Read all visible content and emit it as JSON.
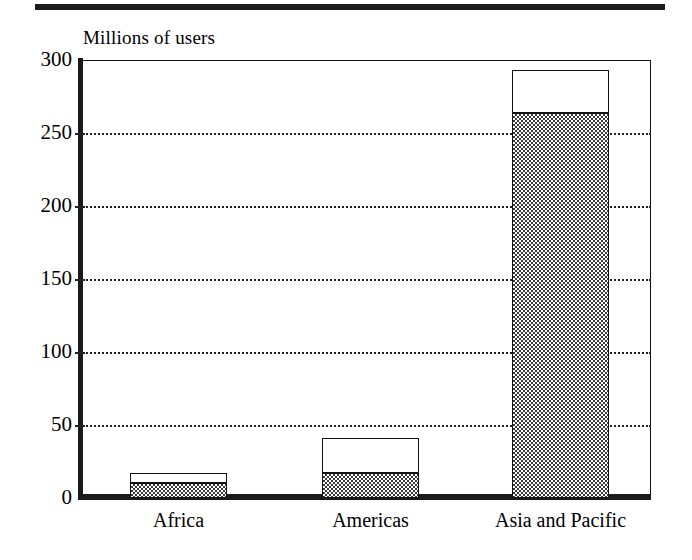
{
  "figure": {
    "top_rule": "decorative-rule"
  },
  "chart_data": {
    "type": "bar",
    "stacked": true,
    "title": "",
    "ylabel": "Millions of users",
    "xlabel": "",
    "categories": [
      "Africa",
      "Americas",
      "Asia and Pacific"
    ],
    "series": [
      {
        "name": "lower-segment",
        "pattern": "checkered",
        "values": [
          10,
          17,
          264
        ]
      },
      {
        "name": "upper-segment",
        "pattern": "white",
        "values": [
          7,
          24,
          29
        ]
      }
    ],
    "totals": [
      17,
      41,
      293
    ],
    "ylim": [
      0,
      300
    ],
    "yticks": [
      0,
      50,
      100,
      150,
      200,
      250,
      300
    ],
    "ytick_labels": [
      "0",
      "50",
      "100",
      "150",
      "200",
      "250",
      "300"
    ],
    "grid": true,
    "grid_style": "dotted",
    "legend": "none",
    "colors": {
      "axis": "#1a1a1a",
      "grid": "#222222",
      "bar_outline": "#111111",
      "bar_fill_white": "#ffffff",
      "bar_fill_checkered": "#3a3a3a"
    }
  }
}
